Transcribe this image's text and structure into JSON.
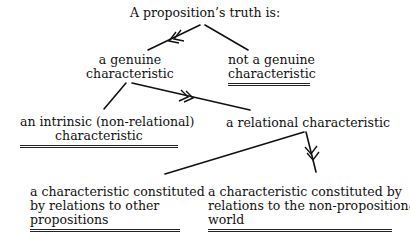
{
  "diagram": {
    "root": "A proposition’s truth is:",
    "nodes": [
      {
        "id": "genuine",
        "lines": [
          "a genuine",
          "characteristic"
        ],
        "terminal": false
      },
      {
        "id": "not_genuine",
        "lines": [
          "not a genuine",
          "characteristic"
        ],
        "terminal": true
      },
      {
        "id": "intrinsic",
        "lines": [
          "an intrinsic (non-relational)",
          "characteristic"
        ],
        "terminal": true
      },
      {
        "id": "relational",
        "lines": [
          "a relational characteristic"
        ],
        "terminal": false
      },
      {
        "id": "other_props",
        "lines": [
          "a characteristic constituted",
          "by relations to other",
          "propositions"
        ],
        "terminal": true
      },
      {
        "id": "non_prop_world",
        "lines": [
          "a characteristic constituted by",
          "relations to the non-propositional",
          "world"
        ],
        "terminal": true
      }
    ],
    "edges": [
      {
        "from": "root",
        "to": "genuine",
        "marked": true
      },
      {
        "from": "root",
        "to": "not_genuine",
        "marked": false
      },
      {
        "from": "genuine",
        "to": "intrinsic",
        "marked": false
      },
      {
        "from": "genuine",
        "to": "relational",
        "marked": true
      },
      {
        "from": "relational",
        "to": "other_props",
        "marked": false
      },
      {
        "from": "relational",
        "to": "non_prop_world",
        "marked": true
      }
    ],
    "legend_note": "double-headed arrow marks chosen branch; double underline marks terminal option"
  }
}
